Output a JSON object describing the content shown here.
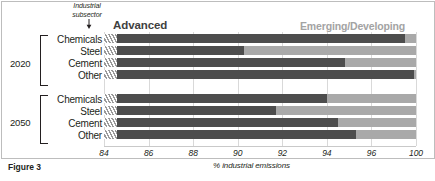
{
  "figure": {
    "caption": "Figure 3",
    "annotation_label_line1": "Industrial",
    "annotation_label_line2": "subsector",
    "annotation_icon": "down-arrow-icon"
  },
  "chart_data": {
    "type": "bar",
    "orientation": "horizontal",
    "stacked": true,
    "title": "",
    "subtitle": "",
    "xlabel": "% industrial emissions",
    "ylabel": "",
    "xlim": [
      84,
      100
    ],
    "xticks": [
      84,
      86,
      88,
      90,
      92,
      94,
      96,
      100
    ],
    "xtick_labels": [
      "84",
      "86",
      "88",
      "90",
      "92",
      "94",
      "96",
      "100"
    ],
    "grid": true,
    "grid_axis": "x",
    "axis_break": true,
    "axis_break_note": "bars begin with a hatched break marker; axis starts at 84 not 0",
    "legend_position": "top",
    "legend": [
      {
        "name": "Advanced",
        "color": "#4d4d4d"
      },
      {
        "name": "Emerging/Developing",
        "color": "#a9a9a9"
      }
    ],
    "groups": [
      {
        "label": "2020",
        "categories": [
          "Chemicals",
          "Steel",
          "Cement",
          "Other"
        ],
        "series": [
          {
            "name": "Advanced",
            "values": [
              99.0,
              90.3,
              94.8,
              99.8
            ]
          },
          {
            "name": "Emerging/Developing",
            "values": [
              100.0,
              100.0,
              100.0,
              100.0
            ]
          }
        ]
      },
      {
        "label": "2050",
        "categories": [
          "Chemicals",
          "Steel",
          "Cement",
          "Other"
        ],
        "series": [
          {
            "name": "Advanced",
            "values": [
              94.0,
              91.7,
              94.5,
              95.3
            ]
          },
          {
            "name": "Emerging/Developing",
            "values": [
              100.0,
              100.0,
              100.0,
              100.0
            ]
          }
        ]
      }
    ]
  },
  "colors": {
    "advanced": "#4d4d4d",
    "emerging": "#a9a9a9",
    "grid": "#d9d9d9",
    "text": "#231f20"
  }
}
